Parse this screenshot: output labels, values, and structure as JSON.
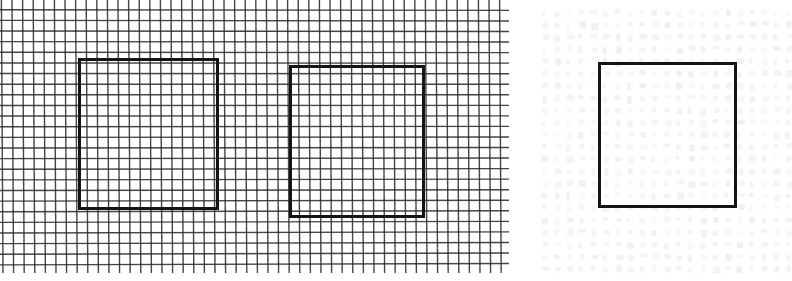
{
  "figure": {
    "width": 792,
    "height": 281,
    "background_color": "#ffffff"
  },
  "panels": [
    {
      "id": "left-grid-panel",
      "name": "dense-grid-panel",
      "x": 0,
      "y": 0,
      "width": 509,
      "height": 273,
      "grid": {
        "type": "ruled-square-grid",
        "cell_size_px": 10.6,
        "line_color": "#2b2b2b",
        "line_width_px": 1.4,
        "columns": 48,
        "rows": 26,
        "visible": true
      },
      "shapes": [
        {
          "id": "square-1",
          "name": "heavy-square-left",
          "type": "square-outline",
          "x": 78,
          "y": 58,
          "width": 141,
          "height": 152,
          "stroke_color": "#141414",
          "stroke_width_px": 3,
          "fill": "none"
        },
        {
          "id": "square-2",
          "name": "heavy-square-right",
          "type": "square-outline",
          "x": 289,
          "y": 65,
          "width": 136,
          "height": 153,
          "stroke_color": "#141414",
          "stroke_width_px": 3,
          "fill": "none"
        }
      ]
    },
    {
      "id": "right-speckle-panel",
      "name": "faint-speckle-panel",
      "x": 534,
      "y": 0,
      "width": 258,
      "height": 281,
      "grid": {
        "type": "faint-dot-field",
        "cell_size_px": 12.2,
        "dot_color": "#f0f0f0",
        "dot_size_px": 7,
        "columns": 21,
        "rows": 23,
        "visible": true
      },
      "shapes": [
        {
          "id": "square-3",
          "name": "heavy-square-faint-panel",
          "type": "square-outline",
          "x": 64,
          "y": 62,
          "width": 139,
          "height": 146,
          "stroke_color": "#141414",
          "stroke_width_px": 3,
          "fill": "none"
        }
      ]
    }
  ],
  "colors": {
    "paper": "#ffffff",
    "grid_line": "#2b2b2b",
    "square_stroke": "#141414",
    "faint_dot": "#f0f0f0"
  }
}
